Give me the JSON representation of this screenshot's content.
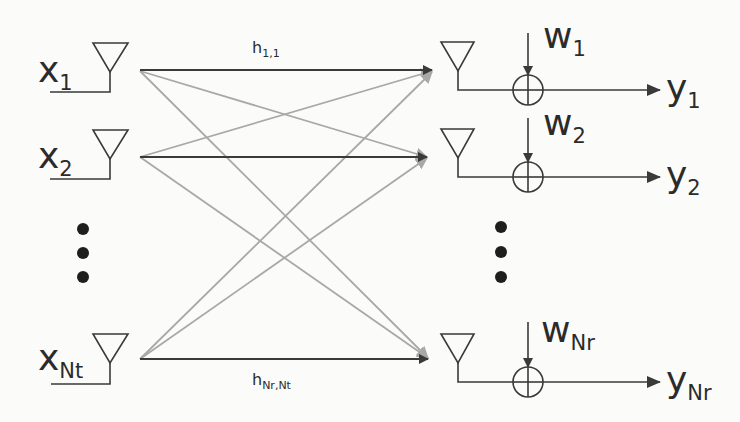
{
  "diagram": {
    "colors": {
      "background": "#fbfbf9",
      "main_line": "#3a3a3a",
      "cross_line": "#a8a8a8",
      "text": "#2b2b2b"
    },
    "transmitters": [
      {
        "symbol": "x",
        "sub": "1",
        "y": 70
      },
      {
        "symbol": "x",
        "sub": "2",
        "y": 157
      },
      {
        "symbol": "x",
        "sub": "Nt",
        "y": 359
      }
    ],
    "receivers": [
      {
        "symbol": "y",
        "sub": "1",
        "noise_symbol": "w",
        "noise_sub": "1",
        "y": 70
      },
      {
        "symbol": "y",
        "sub": "2",
        "noise_symbol": "w",
        "noise_sub": "2",
        "y": 157
      },
      {
        "symbol": "y",
        "sub": "Nr",
        "noise_symbol": "w",
        "noise_sub": "Nr",
        "y": 359
      }
    ],
    "channel_labels": [
      {
        "symbol": "h",
        "sub": "1,1"
      },
      {
        "symbol": "h",
        "sub": "Nr,Nt"
      }
    ],
    "ellipsis": "vertical-dots"
  }
}
